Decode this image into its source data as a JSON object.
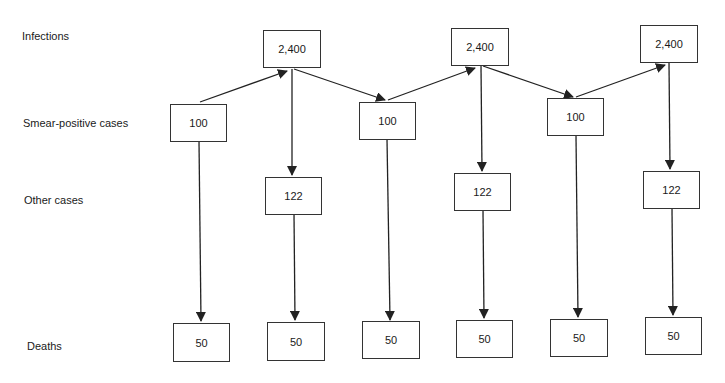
{
  "row_labels": {
    "infections": "Infections",
    "smear_positive": "Smear-positive cases",
    "other": "Other cases",
    "deaths": "Deaths"
  },
  "cycles": [
    {
      "smear_positive": "100",
      "infections": "2,400",
      "other": "122",
      "deaths_smear": "50",
      "deaths_other": "50"
    },
    {
      "smear_positive": "100",
      "infections": "2,400",
      "other": "122",
      "deaths_smear": "50",
      "deaths_other": "50"
    },
    {
      "smear_positive": "100",
      "infections": "2,400",
      "other": "122",
      "deaths_smear": "50",
      "deaths_other": "50"
    }
  ],
  "colors": {
    "line": "#222222",
    "box_border": "#333333",
    "background": "#ffffff"
  }
}
